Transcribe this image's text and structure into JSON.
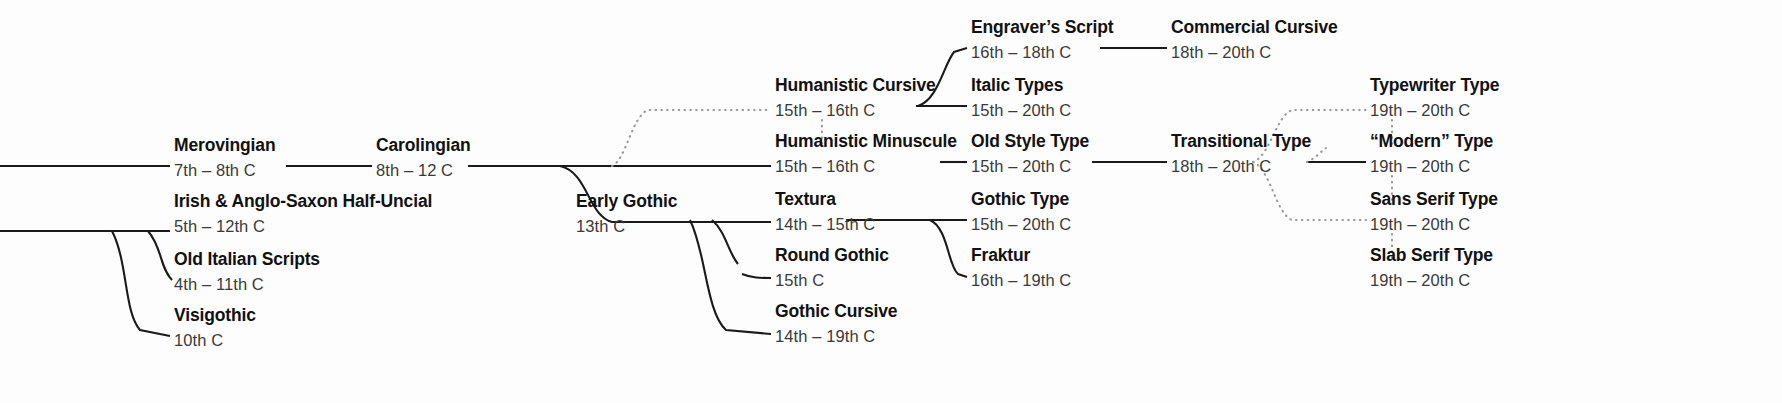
{
  "diagram": {
    "type": "tree",
    "background_color": "#fdfdfd",
    "solid_line_color": "#1a1a1a",
    "dotted_line_color": "#9a9a9a",
    "name_color": "#111111",
    "date_color": "#3a3a3a"
  },
  "nodes": [
    {
      "id": "merovingian",
      "name": "Merovingian",
      "date": "7th – 8th C",
      "x": 174,
      "y": 137
    },
    {
      "id": "carolingian",
      "name": "Carolingian",
      "date": "8th – 12 C",
      "x": 376,
      "y": 137
    },
    {
      "id": "irish_half_uncial",
      "name": "Irish & Anglo-Saxon Half-Uncial",
      "date": "5th – 12th C",
      "x": 174,
      "y": 193
    },
    {
      "id": "old_italian",
      "name": "Old Italian Scripts",
      "date": "4th – 11th C",
      "x": 174,
      "y": 251
    },
    {
      "id": "visigothic",
      "name": "Visigothic",
      "date": "10th C",
      "x": 174,
      "y": 307
    },
    {
      "id": "early_gothic",
      "name": "Early Gothic",
      "date": "13th C",
      "x": 576,
      "y": 193
    },
    {
      "id": "humanistic_cursive",
      "name": "Humanistic Cursive",
      "date": "15th – 16th C",
      "x": 775,
      "y": 77
    },
    {
      "id": "humanistic_minuscule",
      "name": "Humanistic Minuscule",
      "date": "15th – 16th C",
      "x": 775,
      "y": 133
    },
    {
      "id": "textura",
      "name": "Textura",
      "date": "14th – 15th C",
      "x": 775,
      "y": 191
    },
    {
      "id": "round_gothic",
      "name": "Round Gothic",
      "date": "15th C",
      "x": 775,
      "y": 247
    },
    {
      "id": "gothic_cursive",
      "name": "Gothic Cursive",
      "date": "14th – 19th C",
      "x": 775,
      "y": 303
    },
    {
      "id": "engravers_script",
      "name": "Engraver’s Script",
      "date": "16th – 18th C",
      "x": 971,
      "y": 19
    },
    {
      "id": "italic_types",
      "name": "Italic Types",
      "date": "15th – 20th C",
      "x": 971,
      "y": 77
    },
    {
      "id": "old_style_type",
      "name": "Old Style Type",
      "date": "15th – 20th C",
      "x": 971,
      "y": 133
    },
    {
      "id": "gothic_type",
      "name": "Gothic Type",
      "date": "15th – 20th C",
      "x": 971,
      "y": 191
    },
    {
      "id": "fraktur",
      "name": "Fraktur",
      "date": "16th – 19th C",
      "x": 971,
      "y": 247
    },
    {
      "id": "commercial_cursive",
      "name": "Commercial Cursive",
      "date": "18th – 20th C",
      "x": 1171,
      "y": 19
    },
    {
      "id": "transitional_type",
      "name": "Transitional Type",
      "date": "18th – 20th C",
      "x": 1171,
      "y": 133
    },
    {
      "id": "typewriter_type",
      "name": "Typewriter Type",
      "date": "19th – 20th C",
      "x": 1370,
      "y": 77
    },
    {
      "id": "modern_type",
      "name": "“Modern” Type",
      "date": "19th – 20th C",
      "x": 1370,
      "y": 133
    },
    {
      "id": "sans_serif_type",
      "name": "Sans Serif Type",
      "date": "19th – 20th C",
      "x": 1370,
      "y": 191
    },
    {
      "id": "slab_serif_type",
      "name": "Slab Serif Type",
      "date": "19th – 20th C",
      "x": 1370,
      "y": 247
    }
  ],
  "edges": [
    {
      "from": "root-top",
      "to": "merovingian",
      "style": "solid"
    },
    {
      "from": "merovingian",
      "to": "carolingian",
      "style": "solid"
    },
    {
      "from": "root-bottom",
      "to": "irish_half_uncial",
      "style": "solid"
    },
    {
      "from": "root-bottom",
      "to": "old_italian",
      "style": "solid"
    },
    {
      "from": "root-bottom",
      "to": "visigothic",
      "style": "solid"
    },
    {
      "from": "carolingian",
      "to": "humanistic_minuscule",
      "style": "solid"
    },
    {
      "from": "carolingian",
      "to": "early_gothic",
      "style": "solid"
    },
    {
      "from": "carolingian",
      "to": "humanistic_cursive",
      "style": "dotted"
    },
    {
      "from": "humanistic_minuscule",
      "to": "humanistic_cursive",
      "style": "dotted"
    },
    {
      "from": "early_gothic",
      "to": "textura",
      "style": "solid"
    },
    {
      "from": "early_gothic",
      "to": "round_gothic",
      "style": "solid"
    },
    {
      "from": "early_gothic",
      "to": "gothic_cursive",
      "style": "solid"
    },
    {
      "from": "humanistic_cursive",
      "to": "engravers_script",
      "style": "solid"
    },
    {
      "from": "humanistic_cursive",
      "to": "italic_types",
      "style": "solid"
    },
    {
      "from": "humanistic_minuscule",
      "to": "old_style_type",
      "style": "solid"
    },
    {
      "from": "textura",
      "to": "gothic_type",
      "style": "solid"
    },
    {
      "from": "textura",
      "to": "fraktur",
      "style": "solid"
    },
    {
      "from": "engravers_script",
      "to": "commercial_cursive",
      "style": "solid"
    },
    {
      "from": "old_style_type",
      "to": "transitional_type",
      "style": "solid"
    },
    {
      "from": "old_style_type",
      "to": "typewriter_type",
      "style": "dotted"
    },
    {
      "from": "old_style_type",
      "to": "sans_serif_type",
      "style": "dotted"
    },
    {
      "from": "transitional_type",
      "to": "modern_type",
      "style": "solid"
    },
    {
      "from": "modern_type",
      "to": "typewriter_type",
      "style": "dotted"
    },
    {
      "from": "modern_type",
      "to": "sans_serif_type",
      "style": "dotted"
    },
    {
      "from": "sans_serif_type",
      "to": "slab_serif_type",
      "style": "dotted"
    }
  ]
}
